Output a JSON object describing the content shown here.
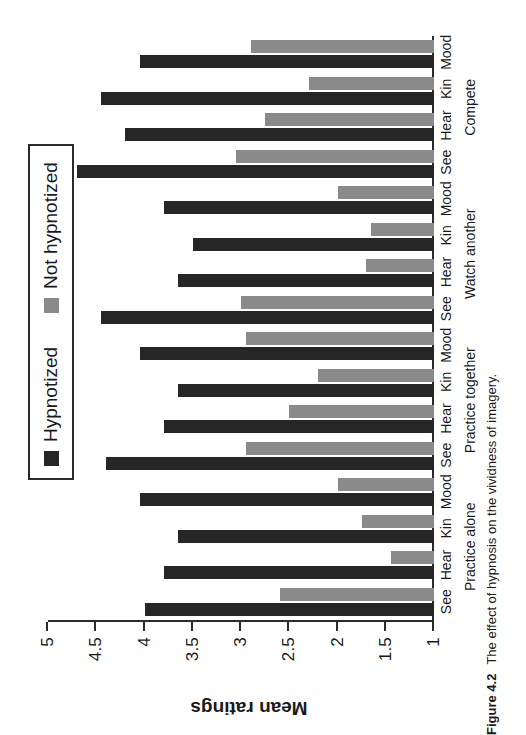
{
  "figure": {
    "number": "Figure 4.2",
    "caption": "The effect of hypnosis on the vividness of imagery."
  },
  "legend": {
    "entries": [
      {
        "label": "Hypnotized",
        "color": "#262626",
        "key": "hypnotized"
      },
      {
        "label": "Not hypnotized",
        "color": "#8a8a8a",
        "key": "not_hypnotized"
      }
    ]
  },
  "axis": {
    "title": "Mean ratings",
    "ticks": [
      "5",
      "4.5",
      "4",
      "3.5",
      "3",
      "2.5",
      "2",
      "1.5",
      "1"
    ]
  },
  "chart_data": {
    "type": "bar",
    "title": "",
    "xlabel": "",
    "ylabel": "Mean ratings",
    "ylim": [
      1,
      5
    ],
    "ytick_values": [
      5,
      4.5,
      4,
      3.5,
      3,
      2.5,
      2,
      1.5,
      1
    ],
    "grid": false,
    "legend_position": "top-center",
    "orientation": "vertical-bars-rotated-page",
    "group_labels": [
      "Practice alone",
      "Practice together",
      "Watch another",
      "Compete"
    ],
    "categories": [
      "See",
      "Hear",
      "Kin",
      "Mood"
    ],
    "groups": [
      {
        "label": "Practice alone",
        "categories": [
          "See",
          "Hear",
          "Kin",
          "Mood"
        ],
        "series": [
          {
            "name": "Hypnotized",
            "values": [
              4.0,
              3.8,
              3.65,
              4.05
            ]
          },
          {
            "name": "Not hypnotized",
            "values": [
              2.6,
              1.45,
              1.75,
              2.0
            ]
          }
        ]
      },
      {
        "label": "Practice together",
        "categories": [
          "See",
          "Hear",
          "Kin",
          "Mood"
        ],
        "series": [
          {
            "name": "Hypnotized",
            "values": [
              4.4,
              3.8,
              3.65,
              4.05
            ]
          },
          {
            "name": "Not hypnotized",
            "values": [
              2.95,
              2.5,
              2.2,
              2.95
            ]
          }
        ]
      },
      {
        "label": "Watch another",
        "categories": [
          "See",
          "Hear",
          "Kin",
          "Mood"
        ],
        "series": [
          {
            "name": "Hypnotized",
            "values": [
              4.45,
              3.65,
              3.5,
              3.8
            ]
          },
          {
            "name": "Not hypnotized",
            "values": [
              3.0,
              1.7,
              1.65,
              2.0
            ]
          }
        ]
      },
      {
        "label": "Compete",
        "categories": [
          "See",
          "Hear",
          "Kin",
          "Mood"
        ],
        "series": [
          {
            "name": "Hypnotized",
            "values": [
              4.7,
              4.2,
              4.45,
              4.05
            ]
          },
          {
            "name": "Not hypnotized",
            "values": [
              3.05,
              2.75,
              2.3,
              2.9
            ]
          }
        ]
      }
    ]
  },
  "colors": {
    "hypnotized": "#262626",
    "not_hypnotized": "#8a8a8a",
    "axis": "#2b2b2b",
    "background": "#ffffff"
  }
}
